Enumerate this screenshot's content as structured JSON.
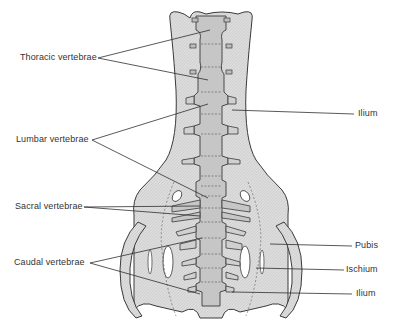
{
  "figure": {
    "colors": {
      "background": "#ffffff",
      "bone_fill": "#d9d9d9",
      "vertebra_fill": "#c4c4c4",
      "outline": "#3a3a3a",
      "label_text": "#333333"
    }
  },
  "labels": {
    "left": [
      {
        "text": "Thoracic vertebrae"
      },
      {
        "text": "Lumbar vertebrae"
      },
      {
        "text": "Sacral vertebrae"
      },
      {
        "text": "Caudal vertebrae"
      }
    ],
    "right": [
      {
        "text": "Ilium"
      },
      {
        "text": "Pubis"
      },
      {
        "text": "Ischium"
      },
      {
        "text": "Ilium"
      }
    ]
  }
}
